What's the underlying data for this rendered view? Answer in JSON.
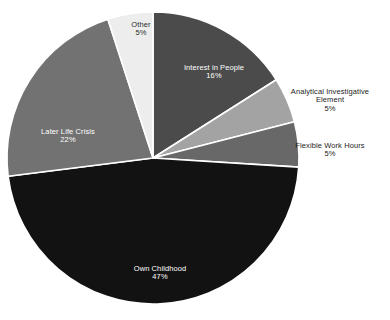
{
  "chart_data": {
    "type": "pie",
    "title": "",
    "subtitle": "",
    "xlabel": "",
    "ylabel": "",
    "legend_position": "none",
    "grid": false,
    "labels_show_percent": true,
    "start_angle_deg": 0,
    "direction": "clockwise",
    "categories": [
      "Interest in People",
      "Analytical Investigative Element",
      "Flexible Work Hours",
      "Own Childhood",
      "Later Life Crisis",
      "Other"
    ],
    "values": [
      16,
      5,
      5,
      47,
      22,
      5
    ],
    "units": "%",
    "colors": [
      "#4b4b4b",
      "#a3a3a3",
      "#686868",
      "#121212",
      "#727272",
      "#ededed"
    ],
    "slices": [
      {
        "name": "Interest in People",
        "value": 16,
        "percent_text": "16%",
        "color": "#4b4b4b",
        "label_placement": "inside",
        "label_color": "#ffffff",
        "label_lines": [
          "Interest in People",
          "16%"
        ]
      },
      {
        "name": "Analytical Investigative Element",
        "value": 5,
        "percent_text": "5%",
        "color": "#a3a3a3",
        "label_placement": "outside",
        "label_color": "#1c1c1c",
        "label_lines": [
          "Analytical Investigative",
          "Element",
          "5%"
        ]
      },
      {
        "name": "Flexible Work Hours",
        "value": 5,
        "percent_text": "5%",
        "color": "#686868",
        "label_placement": "outside",
        "label_color": "#1c1c1c",
        "label_lines": [
          "Flexible Work Hours",
          "5%"
        ]
      },
      {
        "name": "Own Childhood",
        "value": 47,
        "percent_text": "47%",
        "color": "#121212",
        "label_placement": "inside",
        "label_color": "#ffffff",
        "label_lines": [
          "Own Childhood",
          "47%"
        ]
      },
      {
        "name": "Later Life Crisis",
        "value": 22,
        "percent_text": "22%",
        "color": "#727272",
        "label_placement": "inside",
        "label_color": "#ffffff",
        "label_lines": [
          "Later Life Crisis",
          "22%"
        ]
      },
      {
        "name": "Other",
        "value": 5,
        "percent_text": "5%",
        "color": "#ededed",
        "label_placement": "inside",
        "label_color": "#2a2a2a",
        "label_lines": [
          "Other",
          "5%"
        ]
      }
    ]
  },
  "labels": {
    "interest": {
      "name": "Interest in People",
      "pct": "16%"
    },
    "analytical": {
      "line1": "Analytical Investigative",
      "line2": "Element",
      "pct": "5%"
    },
    "flexible": {
      "name": "Flexible Work Hours",
      "pct": "5%"
    },
    "own_childhood": {
      "name": "Own Childhood",
      "pct": "47%"
    },
    "later_life": {
      "name": "Later Life Crisis",
      "pct": "22%"
    },
    "other": {
      "name": "Other",
      "pct": "5%"
    }
  }
}
